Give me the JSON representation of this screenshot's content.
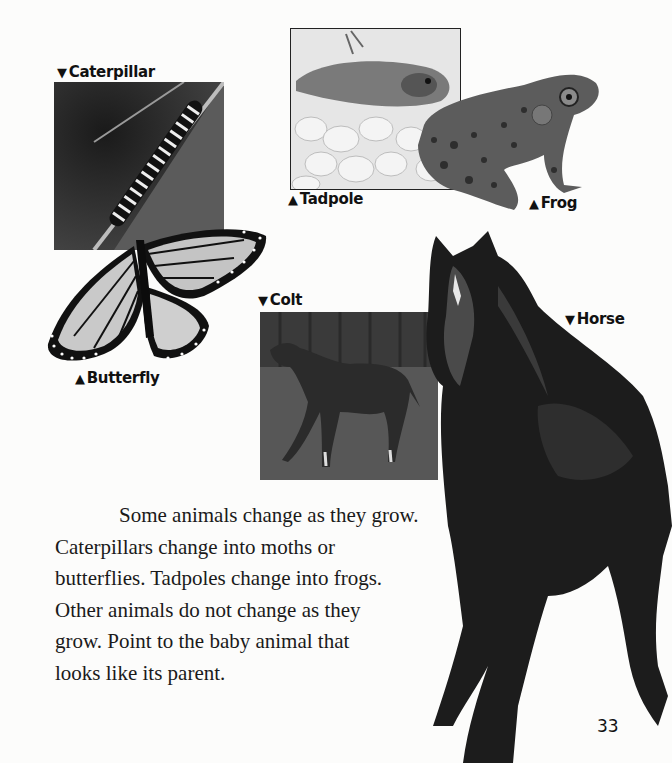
{
  "labels": {
    "caterpillar": {
      "marker": "▼",
      "text": "Caterpillar"
    },
    "butterfly": {
      "marker": "▲",
      "text": "Butterfly"
    },
    "tadpole": {
      "marker": "▲",
      "text": "Tadpole"
    },
    "frog": {
      "marker": "▲",
      "text": "Frog"
    },
    "colt": {
      "marker": "▼",
      "text": "Colt"
    },
    "horse": {
      "marker": "▼",
      "text": "Horse"
    }
  },
  "body": {
    "lines": [
      "Some animals change as they grow.",
      "Caterpillars change into moths or",
      "butterflies. Tadpoles change into frogs.",
      "Other animals do not change as they",
      "grow. Point to the baby animal that",
      "looks like its parent."
    ]
  },
  "page_number": "33",
  "colors": {
    "page_bg": "#fcfcfb",
    "text": "#1a1a1a",
    "photo_border": "#222222"
  }
}
